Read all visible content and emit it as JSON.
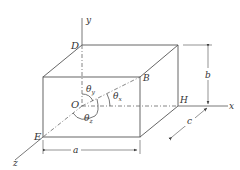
{
  "diagram": {
    "type": "3d-box-direction-angles",
    "colors": {
      "line": "#555555",
      "text": "#333333",
      "background": "#ffffff"
    },
    "axes": {
      "x": "x",
      "y": "y",
      "z": "z"
    },
    "points": {
      "origin": "O",
      "D": "D",
      "B": "B",
      "E": "E",
      "H": "H"
    },
    "angles": {
      "theta_x": "θ",
      "theta_x_sub": "x",
      "theta_y": "θ",
      "theta_y_sub": "y",
      "theta_z": "θ",
      "theta_z_sub": "z"
    },
    "dimensions": {
      "a": "a",
      "b": "b",
      "c": "c"
    }
  }
}
